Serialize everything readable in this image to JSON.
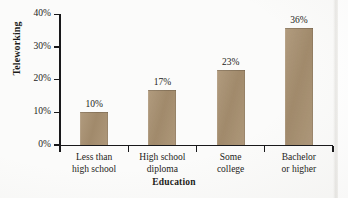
{
  "chart_data": {
    "type": "bar",
    "title": "",
    "xlabel": "Education",
    "ylabel": "Teleworking",
    "categories": [
      "Less than high school",
      "High school diploma",
      "Some college",
      "Bachelor or higher"
    ],
    "category_lines": [
      [
        "Less than",
        "high school"
      ],
      [
        "High school",
        "diploma"
      ],
      [
        "Some",
        "college"
      ],
      [
        "Bachelor",
        "or higher"
      ]
    ],
    "values": [
      10,
      17,
      23,
      36
    ],
    "value_labels": [
      "10%",
      "17%",
      "23%",
      "36%"
    ],
    "ylim": [
      0,
      40
    ],
    "ytick_values": [
      0,
      10,
      20,
      30,
      40
    ],
    "ytick_labels": [
      "0%",
      "10%",
      "20%",
      "30%",
      "40%"
    ],
    "grid": false,
    "legend": null,
    "bar_color": "#a89070",
    "axis_color": "#18181a",
    "text_color": "#1c1b19",
    "background_color": "#fbfbfa"
  }
}
